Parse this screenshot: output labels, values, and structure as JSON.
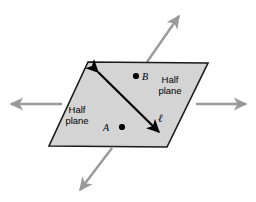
{
  "figure": {
    "background_color": "#ffffff",
    "plane": {
      "name": "shaded-plane-parallelogram",
      "fill_color": "#d4d4d4",
      "stroke_color": "#1a1a1a",
      "stroke_width": 1.6,
      "vertices": [
        {
          "x": 88,
          "y": 62
        },
        {
          "x": 208,
          "y": 63
        },
        {
          "x": 167,
          "y": 147
        },
        {
          "x": 49,
          "y": 146
        }
      ]
    },
    "dividing_line": {
      "name": "line-ell",
      "label": "ℓ",
      "color": "#000000",
      "stroke_width": 2.2,
      "double_headed": true,
      "start": {
        "x": 96,
        "y": 70
      },
      "end": {
        "x": 161,
        "y": 134
      }
    },
    "extension_arrows": {
      "color": "#9a9a9a",
      "stroke_width": 2.4,
      "items": [
        {
          "name": "arrow-left",
          "direction": "left",
          "start": {
            "x": 62,
            "y": 104
          },
          "end": {
            "x": 9,
            "y": 104
          }
        },
        {
          "name": "arrow-right",
          "direction": "right",
          "start": {
            "x": 196,
            "y": 104
          },
          "end": {
            "x": 248,
            "y": 104
          }
        },
        {
          "name": "arrow-upper-right",
          "direction": "up-right",
          "start": {
            "x": 147,
            "y": 62
          },
          "end": {
            "x": 180,
            "y": 14
          }
        },
        {
          "name": "arrow-lower-left",
          "direction": "down-left",
          "start": {
            "x": 112,
            "y": 148
          },
          "end": {
            "x": 79,
            "y": 192
          }
        }
      ]
    },
    "points": [
      {
        "name": "point-a",
        "label": "A",
        "dot": {
          "x": 122,
          "y": 127
        },
        "dot_radius": 3.1,
        "dot_color": "#000000",
        "label_position": "left"
      },
      {
        "name": "point-b",
        "label": "B",
        "dot": {
          "x": 136,
          "y": 76
        },
        "dot_radius": 3.1,
        "dot_color": "#000000",
        "label_position": "right"
      }
    ],
    "region_labels": [
      {
        "name": "half-plane-left",
        "text": "Half\nplane"
      },
      {
        "name": "half-plane-right",
        "text": "Half\nplane"
      }
    ]
  }
}
